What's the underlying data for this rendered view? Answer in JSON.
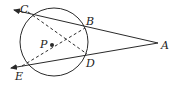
{
  "diagram": {
    "colors": {
      "stroke": "#2a2a2a",
      "background": "#ffffff"
    },
    "circle": {
      "cx": 54,
      "cy": 42,
      "r": 34,
      "center_label": "P"
    },
    "points": {
      "A": {
        "label": "A",
        "x": 158,
        "y": 43
      },
      "B": {
        "label": "B",
        "x": 85,
        "y": 28
      },
      "C": {
        "label": "C",
        "x": 28,
        "y": 12
      },
      "D": {
        "label": "D",
        "x": 87,
        "y": 54
      },
      "E": {
        "label": "E",
        "x": 22,
        "y": 66
      },
      "P": {
        "label": "P",
        "x": 52,
        "y": 45
      }
    },
    "solid_rays": [
      {
        "from": "A",
        "through": "C",
        "arrow": true
      },
      {
        "from": "A",
        "through": "E",
        "arrow": true
      }
    ],
    "dashed_segments": [
      {
        "from": "C",
        "to": "D"
      },
      {
        "from": "E",
        "to": "B"
      }
    ]
  }
}
